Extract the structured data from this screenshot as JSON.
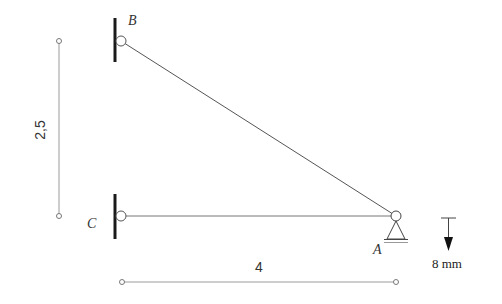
{
  "diagram": {
    "type": "truss-structure",
    "nodes": [
      {
        "id": "B",
        "label": "B",
        "support": "fixed-wall-pin"
      },
      {
        "id": "C",
        "label": "C",
        "support": "fixed-wall-pin"
      },
      {
        "id": "A",
        "label": "A",
        "support": "pin-support"
      }
    ],
    "members": [
      {
        "from": "B",
        "to": "A"
      },
      {
        "from": "C",
        "to": "A"
      }
    ],
    "dimensions": {
      "vertical": {
        "label": "2,5"
      },
      "horizontal": {
        "label": "4"
      }
    },
    "displacement": {
      "node": "A",
      "direction": "down",
      "label": "8 mm"
    },
    "colors": {
      "member": "#555555",
      "wall": "#1a1a1a",
      "dimension": "#888888"
    }
  }
}
